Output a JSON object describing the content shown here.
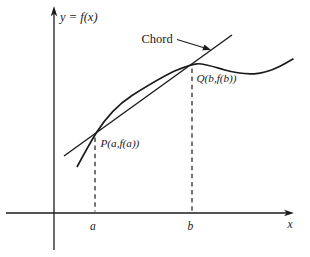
{
  "figure": {
    "labels": {
      "y_axis": "y = f(x)",
      "x_axis": "x",
      "chord": "Chord",
      "point_p": "P(a,f(a))",
      "point_q": "Q(b,f(b))",
      "tick_a": "a",
      "tick_b": "b"
    },
    "colors": {
      "ink": "#1b1b1b",
      "background": "#ffffff"
    }
  }
}
